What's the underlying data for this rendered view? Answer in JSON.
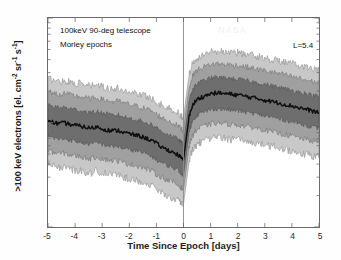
{
  "figure": {
    "annotations": {
      "instrument": "100keV 90-deg telescope",
      "epochs": "Morley epochs",
      "lshell": "L=5.4",
      "watermark": "NASA"
    }
  },
  "axes": {
    "xlabel": "Time Since Epoch [days]",
    "ylabel_pre": ">100 keV electrons [el. cm",
    "ylabel_mid": " sr",
    "ylabel_post": " s",
    "ylabel_close": "]",
    "exp_cm": "-2",
    "exp_sr": "-1",
    "exp_s": "-1",
    "xticks": [
      "-5",
      "-4",
      "-3",
      "-2",
      "-1",
      "0",
      "1",
      "2",
      "3",
      "4",
      "5"
    ],
    "yticks": [
      {
        "mantissa": "10",
        "exponent": "6"
      },
      {
        "mantissa": "10",
        "exponent": "5"
      },
      {
        "mantissa": "10",
        "exponent": "4"
      }
    ]
  },
  "chart_data": {
    "type": "area",
    "xlabel": "Time Since Epoch [days]",
    "ylabel": ">100 keV electrons [el. cm^-2 sr^-1 s^-1]",
    "xlim": [
      -5,
      5
    ],
    "ylim": [
      10000,
      1000000
    ],
    "yscale": "log",
    "xscale": "linear",
    "grid": false,
    "legend": "none",
    "epoch_marker_x": 0,
    "colors": {
      "outer_band": "#c8c8c8",
      "mid_band": "#a0a0a0",
      "inner_band": "#6e6e6e",
      "median_line": "#101010",
      "frame": "#6b6b6b",
      "background": "#ffffff"
    },
    "band_definitions": [
      {
        "name": "5th-95th percentile",
        "shade": "#c8c8c8"
      },
      {
        "name": "17th-83rd percentile",
        "shade": "#a0a0a0"
      },
      {
        "name": "33rd-67th percentile",
        "shade": "#6e6e6e"
      },
      {
        "name": "median",
        "shade": "#101010"
      }
    ],
    "x": [
      -5.0,
      -4.8,
      -4.6,
      -4.4,
      -4.2,
      -4.0,
      -3.8,
      -3.6,
      -3.4,
      -3.2,
      -3.0,
      -2.8,
      -2.6,
      -2.4,
      -2.2,
      -2.0,
      -1.8,
      -1.6,
      -1.4,
      -1.2,
      -1.0,
      -0.8,
      -0.6,
      -0.4,
      -0.2,
      -0.1,
      0.0,
      0.1,
      0.2,
      0.3,
      0.4,
      0.5,
      0.6,
      0.8,
      1.0,
      1.2,
      1.4,
      1.6,
      1.8,
      2.0,
      2.2,
      2.4,
      2.6,
      2.8,
      3.0,
      3.2,
      3.4,
      3.6,
      3.8,
      4.0,
      4.2,
      4.4,
      4.6,
      4.8,
      5.0
    ],
    "series": [
      {
        "name": "median",
        "values": [
          105000,
          100000,
          97000,
          99000,
          96000,
          94000,
          92000,
          90000,
          88000,
          91000,
          87000,
          85000,
          83000,
          84000,
          80000,
          78000,
          76000,
          74000,
          71000,
          68000,
          63000,
          58000,
          55000,
          52000,
          49000,
          46000,
          44000,
          70000,
          110000,
          140000,
          155000,
          165000,
          172000,
          180000,
          188000,
          192000,
          190000,
          188000,
          186000,
          184000,
          180000,
          176000,
          172000,
          168000,
          164000,
          160000,
          156000,
          152000,
          148000,
          144000,
          140000,
          136000,
          132000,
          128000,
          125000
        ]
      },
      {
        "name": "p67",
        "values": [
          148000,
          142000,
          138000,
          140000,
          136000,
          133000,
          130000,
          127000,
          124000,
          128000,
          123000,
          120000,
          117000,
          118000,
          113000,
          110000,
          107000,
          104000,
          100000,
          96000,
          89000,
          82000,
          78000,
          73000,
          69000,
          65000,
          62000,
          99000,
          155000,
          198000,
          219000,
          233000,
          243000,
          254000,
          266000,
          271000,
          268000,
          266000,
          263000,
          260000,
          254000,
          249000,
          243000,
          237000,
          232000,
          226000,
          220000,
          215000,
          209000,
          203000,
          198000,
          192000,
          186000,
          181000,
          177000
        ]
      },
      {
        "name": "p33",
        "values": [
          74000,
          71000,
          69000,
          70000,
          68000,
          66000,
          65000,
          63000,
          62000,
          64000,
          62000,
          60000,
          59000,
          59000,
          56000,
          55000,
          54000,
          52000,
          50000,
          48000,
          44000,
          41000,
          39000,
          37000,
          35000,
          33000,
          31000,
          49000,
          78000,
          99000,
          110000,
          117000,
          122000,
          127000,
          133000,
          136000,
          134000,
          133000,
          131000,
          130000,
          127000,
          124000,
          122000,
          119000,
          116000,
          113000,
          110000,
          107000,
          105000,
          102000,
          99000,
          96000,
          93000,
          90000,
          88000
        ]
      },
      {
        "name": "p83",
        "values": [
          200000,
          192000,
          186000,
          189000,
          184000,
          180000,
          176000,
          172000,
          168000,
          173000,
          166000,
          162000,
          158000,
          160000,
          153000,
          149000,
          145000,
          141000,
          135000,
          130000,
          120000,
          111000,
          105000,
          99000,
          93000,
          88000,
          84000,
          134000,
          210000,
          267000,
          296000,
          315000,
          328000,
          344000,
          359000,
          366000,
          362000,
          359000,
          355000,
          351000,
          344000,
          336000,
          328000,
          321000,
          313000,
          305000,
          298000,
          290000,
          283000,
          275000,
          268000,
          260000,
          252000,
          245000,
          239000
        ]
      },
      {
        "name": "p17",
        "values": [
          54000,
          52000,
          50000,
          51000,
          49000,
          48000,
          47000,
          46000,
          45000,
          47000,
          45000,
          44000,
          43000,
          43000,
          41000,
          40000,
          39000,
          38000,
          36000,
          35000,
          32000,
          30000,
          28000,
          27000,
          25000,
          24000,
          23000,
          36000,
          57000,
          72000,
          80000,
          85000,
          89000,
          93000,
          97000,
          99000,
          98000,
          97000,
          96000,
          95000,
          93000,
          91000,
          89000,
          87000,
          85000,
          82000,
          80000,
          78000,
          76000,
          74000,
          72000,
          70000,
          68000,
          66000,
          64000
        ]
      },
      {
        "name": "p95",
        "values": [
          265000,
          255000,
          247000,
          251000,
          244000,
          239000,
          234000,
          228000,
          223000,
          230000,
          220000,
          215000,
          210000,
          212000,
          203000,
          198000,
          193000,
          187000,
          179000,
          172000,
          159000,
          147000,
          139000,
          131000,
          124000,
          117000,
          111000,
          178000,
          279000,
          354000,
          392000,
          418000,
          435000,
          456000,
          476000,
          485000,
          480000,
          476000,
          471000,
          466000,
          456000,
          446000,
          435000,
          425000,
          415000,
          405000,
          395000,
          385000,
          375000,
          365000,
          355000,
          345000,
          334000,
          325000,
          317000
        ]
      },
      {
        "name": "p5",
        "values": [
          40000,
          38000,
          37000,
          37500,
          36000,
          35000,
          34500,
          33500,
          33000,
          34500,
          33000,
          32000,
          31500,
          31500,
          30000,
          29000,
          28500,
          27500,
          26000,
          25000,
          23000,
          21000,
          20000,
          19000,
          17800,
          17000,
          16500,
          26000,
          41000,
          52000,
          58000,
          61500,
          64500,
          67000,
          70000,
          71500,
          71000,
          70000,
          69000,
          68500,
          67000,
          65500,
          64000,
          62500,
          61000,
          59500,
          58000,
          56500,
          55000,
          53500,
          52000,
          50500,
          49000,
          47500,
          46000
        ]
      }
    ]
  }
}
